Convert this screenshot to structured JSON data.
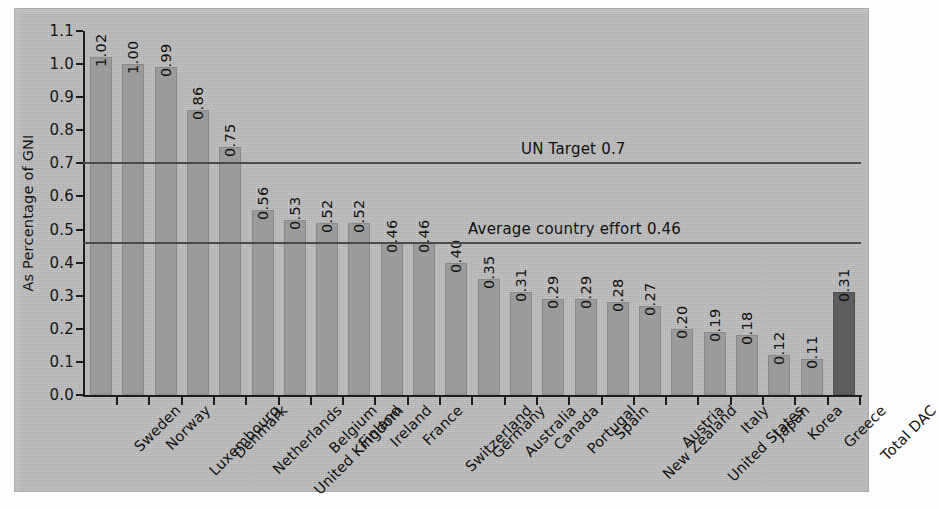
{
  "chart_data": {
    "type": "bar",
    "title": "",
    "xlabel": "",
    "ylabel": "As Percentage of GNI",
    "ylim": [
      0.0,
      1.1
    ],
    "grid": false,
    "legend": "none",
    "ytick_labels": [
      "0.0",
      "0.1",
      "0.2",
      "0.3",
      "0.4",
      "0.5",
      "0.6",
      "0.7",
      "0.8",
      "0.9",
      "1.0",
      "1.1"
    ],
    "ytick_values": [
      0.0,
      0.1,
      0.2,
      0.3,
      0.4,
      0.5,
      0.6,
      0.7,
      0.8,
      0.9,
      1.0,
      1.1
    ],
    "categories": [
      "Sweden",
      "Norway",
      "Luxembourg",
      "Denmark",
      "Netherlands",
      "United Kingdom",
      "Belgium",
      "Finland",
      "Ireland",
      "France",
      "Switzerland",
      "Germany",
      "Australia",
      "Canada",
      "Portugal",
      "Spain",
      "New Zealand",
      "Austria",
      "United States",
      "Italy",
      "Japan",
      "Korea",
      "Greece",
      "Total DAC"
    ],
    "values": [
      1.02,
      1.0,
      0.99,
      0.86,
      0.75,
      0.56,
      0.53,
      0.52,
      0.52,
      0.46,
      0.46,
      0.4,
      0.35,
      0.31,
      0.29,
      0.29,
      0.28,
      0.27,
      0.2,
      0.19,
      0.18,
      0.12,
      0.11,
      0.31
    ],
    "value_labels": [
      "1.02",
      "1.00",
      "0.99",
      "0.86",
      "0.75",
      "0.56",
      "0.53",
      "0.52",
      "0.52",
      "0.46",
      "0.46",
      "0.40",
      "0.35",
      "0.31",
      "0.29",
      "0.29",
      "0.28",
      "0.27",
      "0.20",
      "0.19",
      "0.18",
      "0.12",
      "0.11",
      "0.31"
    ],
    "highlight_index": 23,
    "bar_color": "#9b9b9b",
    "highlight_color": "#5e5e5e",
    "annotations": [
      {
        "label": "UN Target 0.7",
        "value": 0.7
      },
      {
        "label": "Average country effort 0.46",
        "value": 0.46
      }
    ]
  }
}
